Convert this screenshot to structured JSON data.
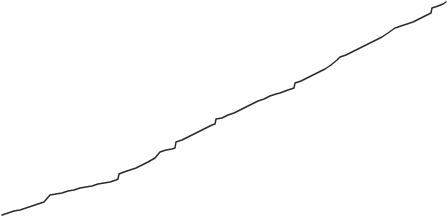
{
  "chart_data": {
    "type": "line",
    "title": "",
    "subtitle": "",
    "xlabel": "",
    "ylabel": "",
    "legend": [],
    "legend_position": "none",
    "grid": false,
    "axes_visible": false,
    "tick_labels_x": [],
    "tick_labels_y": [],
    "background_color": "#ffffff",
    "xlim": [
      0,
      447
    ],
    "ylim": [
      0,
      219
    ],
    "y_axis_inverted": true,
    "annotations": [],
    "series": [
      {
        "name": "series-1",
        "color": "#2b2b2b",
        "line_width": 1.5,
        "monotonic": "increasing",
        "shape": "stair-stepped",
        "points": [
          [
            2,
            215
          ],
          [
            8,
            213
          ],
          [
            14,
            211
          ],
          [
            20,
            210
          ],
          [
            26,
            208
          ],
          [
            32,
            206
          ],
          [
            38,
            204
          ],
          [
            44,
            202
          ],
          [
            50,
            195
          ],
          [
            56,
            194
          ],
          [
            62,
            193
          ],
          [
            68,
            191
          ],
          [
            74,
            190
          ],
          [
            80,
            188
          ],
          [
            86,
            187
          ],
          [
            92,
            186
          ],
          [
            98,
            184
          ],
          [
            104,
            183
          ],
          [
            110,
            182
          ],
          [
            116,
            180
          ],
          [
            118,
            179
          ],
          [
            119,
            174
          ],
          [
            124,
            172
          ],
          [
            130,
            170
          ],
          [
            136,
            168
          ],
          [
            142,
            165
          ],
          [
            148,
            162
          ],
          [
            155,
            158
          ],
          [
            160,
            152
          ],
          [
            166,
            150
          ],
          [
            172,
            149
          ],
          [
            175,
            148
          ],
          [
            176,
            142
          ],
          [
            182,
            140
          ],
          [
            188,
            137
          ],
          [
            194,
            134
          ],
          [
            200,
            131
          ],
          [
            206,
            128
          ],
          [
            212,
            125
          ],
          [
            215,
            124
          ],
          [
            216,
            119
          ],
          [
            222,
            118
          ],
          [
            228,
            115
          ],
          [
            234,
            113
          ],
          [
            240,
            110
          ],
          [
            246,
            107
          ],
          [
            252,
            104
          ],
          [
            258,
            101
          ],
          [
            264,
            99
          ],
          [
            270,
            96
          ],
          [
            276,
            94
          ],
          [
            280,
            93
          ],
          [
            288,
            90
          ],
          [
            294,
            88
          ],
          [
            295,
            83
          ],
          [
            301,
            81
          ],
          [
            307,
            78
          ],
          [
            313,
            75
          ],
          [
            319,
            72
          ],
          [
            325,
            69
          ],
          [
            331,
            65
          ],
          [
            337,
            60
          ],
          [
            340,
            57
          ],
          [
            346,
            55
          ],
          [
            352,
            52
          ],
          [
            358,
            49
          ],
          [
            364,
            46
          ],
          [
            370,
            43
          ],
          [
            376,
            40
          ],
          [
            382,
            37
          ],
          [
            388,
            33
          ],
          [
            395,
            28
          ],
          [
            401,
            26
          ],
          [
            407,
            24
          ],
          [
            413,
            22
          ],
          [
            419,
            19
          ],
          [
            425,
            16
          ],
          [
            431,
            13
          ],
          [
            432,
            8
          ],
          [
            438,
            6
          ],
          [
            443,
            4
          ],
          [
            446,
            2
          ]
        ]
      }
    ]
  }
}
